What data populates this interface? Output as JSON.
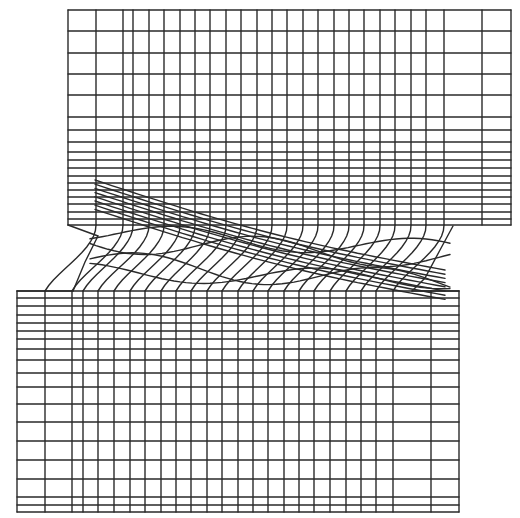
{
  "diagram": {
    "type": "deformed-finite-element-mesh",
    "stroke_color": "#2a2a2a",
    "background_color": "#ffffff",
    "top_block": {
      "x_lines": [
        68,
        96,
        123,
        133,
        149,
        164,
        180,
        195,
        210,
        226,
        241,
        257,
        272,
        287,
        303,
        318,
        334,
        349,
        364,
        380,
        395,
        411,
        426,
        444,
        482,
        511
      ],
      "y_lines": [
        10,
        31,
        53,
        74,
        95,
        117,
        130,
        142,
        152,
        160,
        168,
        176,
        183,
        190,
        197,
        204,
        212,
        219,
        225
      ],
      "x_left": 68,
      "x_right": 511,
      "y_top": 10,
      "y_bottom": 225
    },
    "bottom_block": {
      "x_lines": [
        17,
        45,
        72,
        83,
        98,
        114,
        130,
        145,
        161,
        176,
        191,
        207,
        222,
        238,
        253,
        268,
        284,
        299,
        314,
        330,
        346,
        361,
        376,
        393,
        431,
        459
      ],
      "y_lines": [
        291,
        298,
        306,
        315,
        323,
        331,
        339,
        349,
        360,
        373,
        387,
        404,
        422,
        441,
        460,
        479,
        497,
        505,
        512
      ],
      "x_left": 17,
      "x_right": 459,
      "y_top": 291,
      "y_bottom": 512
    },
    "shear_band": {
      "left_free_edge": [
        [
          68,
          225
        ],
        [
          98,
          236
        ],
        [
          85,
          262
        ],
        [
          73,
          291
        ]
      ],
      "right_free_edge": [
        [
          453,
          226
        ],
        [
          440,
          250
        ],
        [
          425,
          278
        ],
        [
          412,
          291
        ]
      ],
      "band_lines": 8
    }
  }
}
